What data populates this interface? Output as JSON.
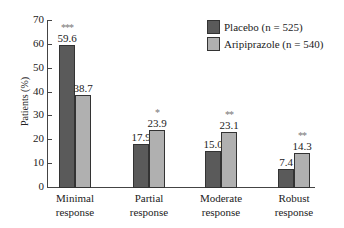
{
  "chart_data": {
    "type": "bar",
    "title": "",
    "xlabel": "",
    "ylabel": "Patients (%)",
    "ylim": [
      0,
      70
    ],
    "yticks": [
      0,
      10,
      20,
      30,
      40,
      50,
      60,
      70
    ],
    "grid": false,
    "legend_position": "top-right",
    "categories": [
      "Minimal response",
      "Partial response",
      "Moderate response",
      "Robust response"
    ],
    "category_lines": [
      [
        "Minimal",
        "response"
      ],
      [
        "Partial",
        "response"
      ],
      [
        "Moderate",
        "response"
      ],
      [
        "Robust",
        "response"
      ]
    ],
    "series": [
      {
        "name": "Placebo (n = 525)",
        "color": "#5a5a5a",
        "values": [
          59.6,
          17.9,
          15.0,
          7.4
        ],
        "labels": [
          "59.6",
          "17.9",
          "15.0",
          "7.4"
        ]
      },
      {
        "name": "Aripiprazole (n = 540)",
        "color": "#b0b0b0",
        "values": [
          38.7,
          23.9,
          23.1,
          14.3
        ],
        "labels": [
          "38.7",
          "23.9",
          "23.1",
          "14.3"
        ]
      }
    ],
    "annotations": [
      {
        "category": "Minimal response",
        "series": "Placebo (n = 525)",
        "text": "***"
      },
      {
        "category": "Partial response",
        "series": "Aripiprazole (n = 540)",
        "text": "*"
      },
      {
        "category": "Moderate response",
        "series": "Aripiprazole (n = 540)",
        "text": "**"
      },
      {
        "category": "Robust response",
        "series": "Aripiprazole (n = 540)",
        "text": "**"
      }
    ]
  }
}
